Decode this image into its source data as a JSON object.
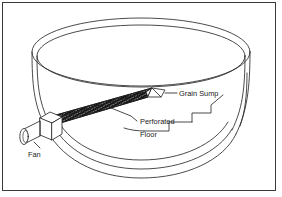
{
  "figure": {
    "type": "technical-line-diagram",
    "background_color": "#ffffff",
    "line_color": "#2b2b2b",
    "border_color": "#3a3a3a",
    "hatch_color": "#1a1a1a"
  },
  "labels": {
    "grain_sump": "Grain Sump",
    "perforated": "Perforated",
    "floor": "Floor",
    "fan": "Fan"
  },
  "components": [
    {
      "name": "grain-bin",
      "label": ""
    },
    {
      "name": "perforated-floor-duct",
      "label": "Perforated Floor"
    },
    {
      "name": "grain-sump",
      "label": "Grain Sump"
    },
    {
      "name": "fan",
      "label": "Fan"
    }
  ]
}
